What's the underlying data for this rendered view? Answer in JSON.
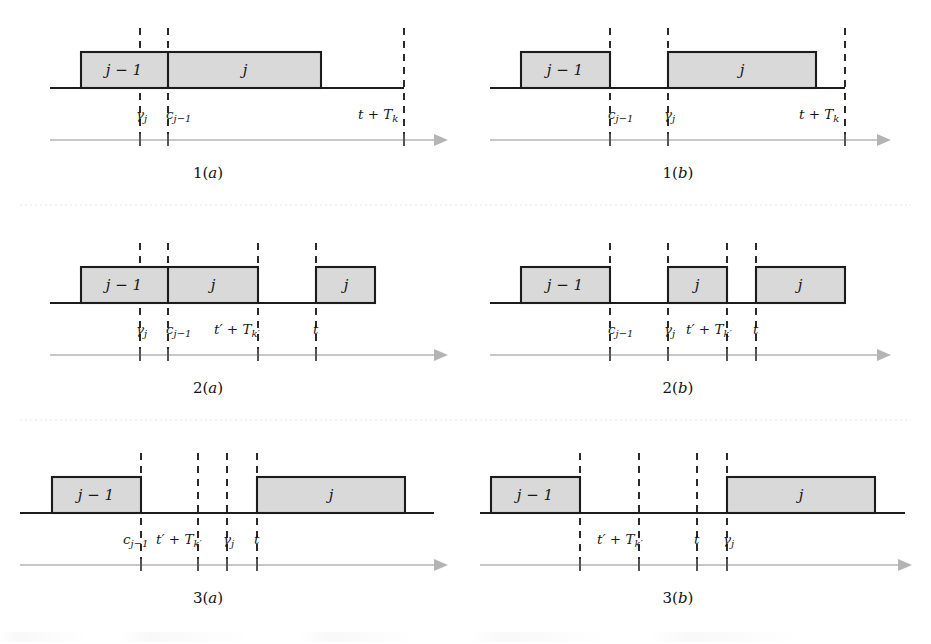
{
  "figure": {
    "kind": "scheduling-timeline-figure",
    "canvas": {
      "width": 931,
      "height": 644
    },
    "colors": {
      "box_fill": "#d9d9d9",
      "box_stroke": "#1c1c1c",
      "baseline": "#1c1c1c",
      "marker_dash": "#2a2a2a",
      "time_axis": "#b4b4b4",
      "row_separator": "#e8e8e8",
      "background": "#ffffff"
    },
    "job_labels": {
      "previous": "j − 1",
      "current": "j"
    },
    "tick_symbols": {
      "gamma_j": "γ",
      "gamma_j_sub": "j",
      "c_prev": "c",
      "c_prev_sub": "j−1",
      "t_plus_Tk": "t + T",
      "t_plus_Tk_sub": "k",
      "tprime_plus_Tkprime": "t′ + T",
      "tprime_plus_Tkprime_sub": "k′",
      "t": "t"
    },
    "panels": [
      {
        "id": "1a",
        "caption": "1(a)",
        "caption_number": "1",
        "caption_letter": "a",
        "boxes": [
          {
            "label": "j − 1",
            "name": "job-prev"
          },
          {
            "label": "j",
            "name": "job-current"
          }
        ],
        "ticks": [
          {
            "name": "gamma-j",
            "text": "γ",
            "sub": "j"
          },
          {
            "name": "c-j-minus-1",
            "text": "c",
            "sub": "j−1"
          },
          {
            "name": "t-plus-Tk",
            "text": "t + T",
            "sub": "k"
          }
        ]
      },
      {
        "id": "1b",
        "caption": "1(b)",
        "caption_number": "1",
        "caption_letter": "b",
        "boxes": [
          {
            "label": "j − 1",
            "name": "job-prev"
          },
          {
            "label": "j",
            "name": "job-current"
          }
        ],
        "ticks": [
          {
            "name": "c-j-minus-1",
            "text": "c",
            "sub": "j−1"
          },
          {
            "name": "gamma-j",
            "text": "γ",
            "sub": "j"
          },
          {
            "name": "t-plus-Tk",
            "text": "t + T",
            "sub": "k"
          }
        ]
      },
      {
        "id": "2a",
        "caption": "2(a)",
        "caption_number": "2",
        "caption_letter": "a",
        "boxes": [
          {
            "label": "j − 1",
            "name": "job-prev"
          },
          {
            "label": "j",
            "name": "job-current"
          },
          {
            "label": "j",
            "name": "job-current-second"
          }
        ],
        "ticks": [
          {
            "name": "gamma-j",
            "text": "γ",
            "sub": "j"
          },
          {
            "name": "c-j-minus-1",
            "text": "c",
            "sub": "j−1"
          },
          {
            "name": "tprime-plus-Tkprime",
            "text": "t′ + T",
            "sub": "k′"
          },
          {
            "name": "t",
            "text": "t",
            "sub": ""
          }
        ]
      },
      {
        "id": "2b",
        "caption": "2(b)",
        "caption_number": "2",
        "caption_letter": "b",
        "boxes": [
          {
            "label": "j − 1",
            "name": "job-prev"
          },
          {
            "label": "j",
            "name": "job-current"
          },
          {
            "label": "j",
            "name": "job-current-second"
          }
        ],
        "ticks": [
          {
            "name": "c-j-minus-1",
            "text": "c",
            "sub": "j−1"
          },
          {
            "name": "gamma-j",
            "text": "γ",
            "sub": "j"
          },
          {
            "name": "tprime-plus-Tkprime",
            "text": "t′ + T",
            "sub": "k′"
          },
          {
            "name": "t",
            "text": "t",
            "sub": ""
          }
        ]
      },
      {
        "id": "3a",
        "caption": "3(a)",
        "caption_number": "3",
        "caption_letter": "a",
        "boxes": [
          {
            "label": "j − 1",
            "name": "job-prev"
          },
          {
            "label": "j",
            "name": "job-current"
          }
        ],
        "ticks": [
          {
            "name": "c-j-minus-1",
            "text": "c",
            "sub": "j−1"
          },
          {
            "name": "tprime-plus-Tkprime",
            "text": "t′ + T",
            "sub": "k′"
          },
          {
            "name": "gamma-j",
            "text": "γ",
            "sub": "j"
          },
          {
            "name": "t",
            "text": "t",
            "sub": ""
          }
        ]
      },
      {
        "id": "3b",
        "caption": "3(b)",
        "caption_number": "3",
        "caption_letter": "b",
        "boxes": [
          {
            "label": "j − 1",
            "name": "job-prev"
          },
          {
            "label": "j",
            "name": "job-current"
          }
        ],
        "ticks": [
          {
            "name": "tprime-plus-Tkprime",
            "text": "t′ + T",
            "sub": "k′"
          },
          {
            "name": "t",
            "text": "t",
            "sub": ""
          },
          {
            "name": "gamma-j",
            "text": "γ",
            "sub": "j"
          }
        ]
      }
    ]
  }
}
